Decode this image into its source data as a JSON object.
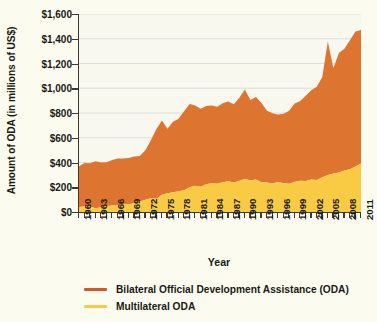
{
  "chart_data": {
    "type": "area",
    "stacked": true,
    "title": "",
    "xlabel": "Year",
    "ylabel": "Amount of ODA (in millions of US$)",
    "xlim": [
      1960,
      2011
    ],
    "ylim": [
      0,
      1600
    ],
    "ytick_values": [
      0,
      200,
      400,
      600,
      800,
      1000,
      1200,
      1400,
      1600
    ],
    "ytick_labels": [
      "$0",
      "$200",
      "$400",
      "$600",
      "$800",
      "$1,000",
      "$1,200",
      "$1,400",
      "$1,600"
    ],
    "xtick_labels": [
      "1960",
      "1963",
      "1966",
      "1969",
      "1972",
      "1975",
      "1978",
      "1981",
      "1984",
      "1987",
      "1990",
      "1993",
      "1996",
      "1999",
      "2002",
      "2005",
      "2008",
      "2011"
    ],
    "xtick_step": 3,
    "grid": "horizontal",
    "legend_position": "bottom-left",
    "x": [
      1960,
      1961,
      1962,
      1963,
      1964,
      1965,
      1966,
      1967,
      1968,
      1969,
      1970,
      1971,
      1972,
      1973,
      1974,
      1975,
      1976,
      1977,
      1978,
      1979,
      1980,
      1981,
      1982,
      1983,
      1984,
      1985,
      1986,
      1987,
      1988,
      1989,
      1990,
      1991,
      1992,
      1993,
      1994,
      1995,
      1996,
      1997,
      1998,
      1999,
      2000,
      2001,
      2002,
      2003,
      2004,
      2005,
      2006,
      2007,
      2008,
      2009,
      2010,
      2011
    ],
    "series": [
      {
        "name": "Multilateral ODA",
        "color": "#f9cb45",
        "values": [
          40,
          45,
          42,
          30,
          38,
          48,
          52,
          55,
          60,
          62,
          70,
          85,
          98,
          112,
          108,
          140,
          152,
          160,
          168,
          175,
          200,
          212,
          205,
          225,
          232,
          228,
          240,
          248,
          238,
          252,
          268,
          255,
          262,
          240,
          238,
          230,
          242,
          232,
          228,
          245,
          252,
          250,
          262,
          258,
          280,
          300,
          312,
          320,
          335,
          345,
          368,
          392
        ]
      },
      {
        "name": "Bilateral Official Development Assistance (ODA)",
        "color": "#dd7530",
        "values": [
          330,
          350,
          352,
          380,
          362,
          355,
          368,
          378,
          372,
          375,
          378,
          368,
          400,
          468,
          562,
          600,
          520,
          570,
          585,
          640,
          672,
          648,
          630,
          632,
          628,
          622,
          638,
          645,
          632,
          672,
          722,
          650,
          668,
          640,
          580,
          568,
          545,
          562,
          590,
          632,
          645,
          690,
          722,
          755,
          810,
          1078,
          850,
          965,
          985,
          1042,
          1090,
          1078
        ]
      }
    ],
    "totals": [
      370,
      395,
      394,
      410,
      400,
      403,
      420,
      433,
      432,
      437,
      448,
      453,
      498,
      580,
      670,
      740,
      672,
      730,
      753,
      815,
      872,
      860,
      835,
      857,
      860,
      850,
      878,
      893,
      870,
      924,
      990,
      905,
      930,
      880,
      818,
      798,
      787,
      794,
      818,
      877,
      897,
      940,
      984,
      1013,
      1090,
      1378,
      1162,
      1285,
      1320,
      1387,
      1458,
      1470
    ]
  },
  "axis": {
    "ylabel": "Amount of ODA (in millions of US$)",
    "xlabel": "Year"
  },
  "legend": {
    "items": [
      {
        "label": "Bilateral Official Development Assistance (ODA)",
        "color": "#d1582b"
      },
      {
        "label": "Multilateral ODA",
        "color": "#f9cb45"
      }
    ]
  },
  "colors": {
    "background": "#fbfbf0",
    "plot_background": "#f8f8ef",
    "bilateral_area": "#dd7530",
    "multilateral_area": "#f9cb45",
    "axis": "#3a3a32",
    "grid": "#dededa",
    "text": "#1a1a14"
  }
}
